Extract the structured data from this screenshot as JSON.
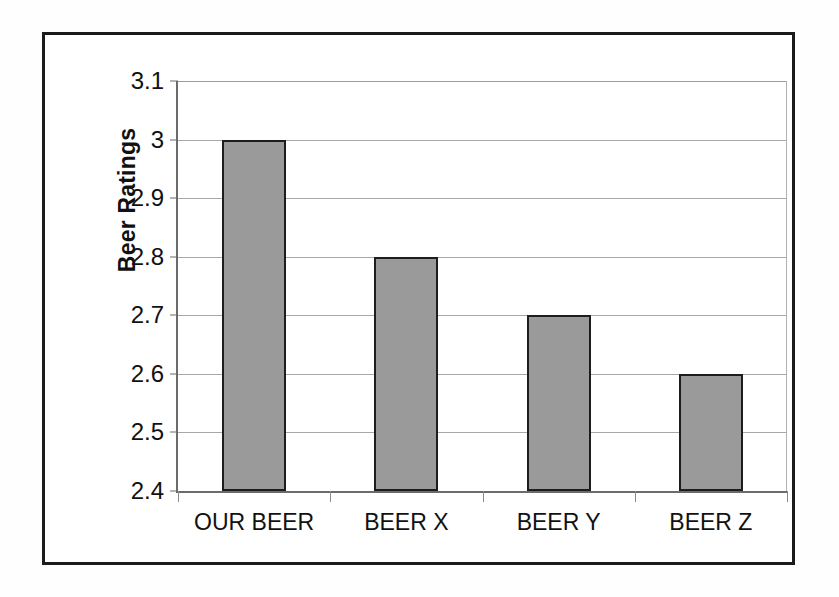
{
  "chart_data": {
    "type": "bar",
    "title": "",
    "xlabel": "",
    "ylabel": "Beer Ratings",
    "categories": [
      "OUR BEER",
      "BEER X",
      "BEER Y",
      "BEER Z"
    ],
    "values": [
      3.0,
      2.8,
      2.7,
      2.6
    ],
    "series": [
      {
        "name": "Beer Ratings",
        "values": [
          3.0,
          2.8,
          2.7,
          2.6
        ]
      }
    ],
    "ylim": [
      2.4,
      3.1
    ],
    "ytick_labels": [
      "3.1",
      "3",
      "2.9",
      "2.8",
      "2.7",
      "2.6",
      "2.5",
      "2.4"
    ],
    "ytick_values": [
      3.1,
      3.0,
      2.9,
      2.8,
      2.7,
      2.6,
      2.5,
      2.4
    ],
    "ytick_step": 0.1,
    "grid": "horizontal",
    "legend": "none",
    "annotations": [],
    "colors": {
      "bar_fill": "#9a9a9a",
      "bar_outline": "#1d1d1d",
      "gridline": "#a8a8a8",
      "axis": "#6b6b6b",
      "frame": "#1b1b1b",
      "text": "#111111",
      "background": "#ffffff"
    }
  }
}
